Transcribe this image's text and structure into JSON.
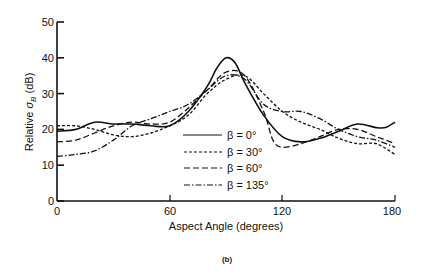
{
  "chart_data": {
    "type": "line",
    "title": "",
    "caption": "(b)",
    "xlabel": "Aspect Angle (degrees)",
    "ylabel": "Relative σB (dB)",
    "xlim": [
      0,
      180
    ],
    "ylim": [
      0,
      50
    ],
    "xticks": [
      0,
      60,
      120,
      180
    ],
    "yticks": [
      0,
      10,
      20,
      30,
      40,
      50
    ],
    "grid": false,
    "legend_position": "lower center",
    "series": [
      {
        "name": "β = 0°",
        "style": "solid",
        "x": [
          0,
          10,
          20,
          30,
          40,
          50,
          60,
          70,
          80,
          85,
          90,
          95,
          100,
          110,
          120,
          130,
          140,
          150,
          160,
          170,
          175,
          180
        ],
        "y": [
          19.5,
          20,
          22,
          21.5,
          21.5,
          21,
          21,
          25,
          32,
          37,
          40,
          38.5,
          33,
          24,
          18,
          16.5,
          17.5,
          19.5,
          21.5,
          20.5,
          20.5,
          22
        ]
      },
      {
        "name": "β = 30°",
        "style": "dotted",
        "x": [
          0,
          10,
          20,
          30,
          40,
          50,
          60,
          70,
          80,
          90,
          100,
          110,
          120,
          130,
          140,
          150,
          160,
          170,
          180
        ],
        "y": [
          21,
          21,
          20,
          18.5,
          18,
          19,
          21,
          24,
          30,
          34,
          35,
          30,
          25,
          22,
          20,
          17.5,
          16,
          16,
          13
        ]
      },
      {
        "name": "β = 60°",
        "style": "dashed",
        "x": [
          0,
          10,
          20,
          30,
          40,
          50,
          60,
          70,
          80,
          90,
          100,
          110,
          115,
          120,
          130,
          140,
          150,
          160,
          170,
          180
        ],
        "y": [
          16.5,
          17,
          19,
          21,
          22,
          21.5,
          22,
          26,
          31,
          36,
          35,
          25,
          17,
          15,
          16,
          18,
          20,
          20,
          18,
          16
        ]
      },
      {
        "name": "β = 135°",
        "style": "dash-dot",
        "x": [
          0,
          10,
          20,
          30,
          40,
          50,
          60,
          70,
          80,
          90,
          100,
          110,
          120,
          130,
          140,
          150,
          160,
          170,
          180
        ],
        "y": [
          12.5,
          13,
          14,
          17,
          21,
          23,
          25,
          27,
          31,
          35,
          34,
          27,
          25,
          25,
          23,
          20,
          18,
          17,
          15
        ]
      }
    ]
  },
  "legend": [
    {
      "label": "β = 0°"
    },
    {
      "label": "β = 30°"
    },
    {
      "label": "β = 60°"
    },
    {
      "label": "β = 135°"
    }
  ],
  "axes": {
    "xlabel": "Aspect Angle (degrees)",
    "ylabel_main": "Relative ",
    "ylabel_sym": "σ",
    "ylabel_sub": "B",
    "ylabel_unit": " (dB)",
    "xticks": [
      "0",
      "60",
      "120",
      "180"
    ],
    "yticks": [
      "0",
      "10",
      "20",
      "30",
      "40",
      "50"
    ]
  },
  "caption": "(b)"
}
